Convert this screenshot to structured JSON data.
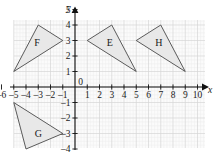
{
  "chart_data": {
    "type": "scatter",
    "title": "",
    "xlabel": "x",
    "ylabel": "y",
    "xlim": [
      -6.6,
      10.6
    ],
    "ylim": [
      -5.4,
      5.4
    ],
    "grid": true,
    "minor_grid": true,
    "minor_subdivisions": 4,
    "legend": "none",
    "x_ticks": [
      -6,
      -5,
      -4,
      -3,
      -2,
      -1,
      0,
      1,
      2,
      3,
      4,
      5,
      6,
      7,
      8,
      9,
      10
    ],
    "x_tick_labels": [
      "–6",
      "–5",
      "–4",
      "–3",
      "–2",
      "–1",
      "0",
      "1",
      "2",
      "3",
      "4",
      "5",
      "6",
      "7",
      "8",
      "9",
      "10"
    ],
    "y_ticks": [
      -5,
      -4,
      -3,
      -2,
      -1,
      1,
      2,
      3,
      4,
      5
    ],
    "y_tick_labels": [
      "–5",
      "–4",
      "–3",
      "–2",
      "–1",
      "1",
      "2",
      "3",
      "4",
      "5"
    ],
    "origin_label": "0",
    "shapes": [
      {
        "name": "F",
        "label": "F",
        "kind": "triangle",
        "vertices": [
          [
            -5,
            1
          ],
          [
            -3,
            4
          ],
          [
            -1,
            3
          ]
        ],
        "label_at": [
          -3.1,
          2.85
        ],
        "fill": "#e8e8e8",
        "stroke": "#4a4a4a"
      },
      {
        "name": "E",
        "label": "E",
        "kind": "triangle",
        "vertices": [
          [
            1,
            3
          ],
          [
            3,
            4
          ],
          [
            5,
            1
          ]
        ],
        "label_at": [
          2.85,
          2.85
        ],
        "fill": "#e8e8e8",
        "stroke": "#4a4a4a"
      },
      {
        "name": "H",
        "label": "H",
        "kind": "triangle",
        "vertices": [
          [
            5,
            3
          ],
          [
            7,
            4
          ],
          [
            9,
            1
          ]
        ],
        "label_at": [
          6.85,
          2.85
        ],
        "fill": "#e8e8e8",
        "stroke": "#4a4a4a"
      },
      {
        "name": "G",
        "label": "G",
        "kind": "triangle",
        "vertices": [
          [
            -5,
            -1
          ],
          [
            -4,
            -4
          ],
          [
            -1,
            -3
          ]
        ],
        "label_at": [
          -3.0,
          -3.0
        ],
        "fill": "#e8e8e8",
        "stroke": "#4a4a4a"
      }
    ],
    "axis_color": "#111111",
    "grid_color": "#d6d6d6",
    "minor_grid_color": "#ececec",
    "plot_background": "#fbfbfb"
  }
}
